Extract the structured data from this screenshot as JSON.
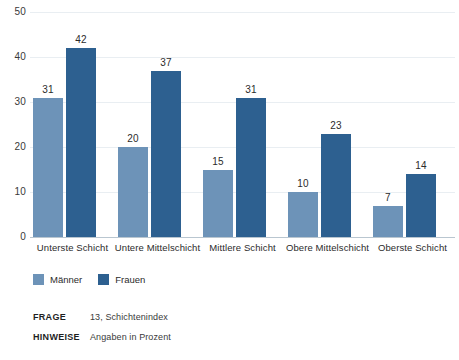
{
  "chart_data": {
    "type": "bar",
    "title": "",
    "xlabel": "",
    "ylabel": "",
    "ylim": [
      0,
      50
    ],
    "yticks": [
      0,
      10,
      20,
      30,
      40,
      50
    ],
    "grid": true,
    "legend_position": "bottom-left",
    "categories": [
      "Unterste Schicht",
      "Untere Mittelschicht",
      "Mittlere Schicht",
      "Obere Mittelschicht",
      "Oberste Schicht"
    ],
    "series": [
      {
        "name": "Männer",
        "color": "#6d93b8",
        "values": [
          31,
          20,
          15,
          10,
          7
        ]
      },
      {
        "name": "Frauen",
        "color": "#2d6090",
        "values": [
          42,
          37,
          31,
          23,
          14
        ]
      }
    ]
  },
  "footnotes": [
    {
      "key": "FRAGE",
      "value": "13, Schichtenindex"
    },
    {
      "key": "HINWEISE",
      "value": "Angaben in Prozent"
    }
  ]
}
